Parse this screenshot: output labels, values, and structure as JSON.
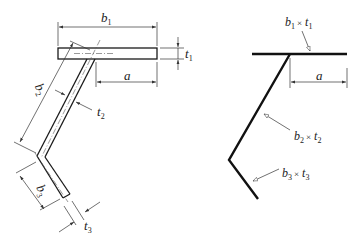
{
  "diagram": {
    "colors": {
      "stroke": "#1a1a1a",
      "dim": "#333333",
      "text": "#222222",
      "background": "#ffffff"
    },
    "left_figure": {
      "description": "Z-shaped section with flange, web and lip, dimensioned",
      "labels": {
        "b1": {
          "base": "b",
          "sub": "1"
        },
        "t1": {
          "base": "t",
          "sub": "1"
        },
        "a": {
          "base": "a"
        },
        "b2": {
          "base": "b",
          "sub": "2"
        },
        "t2": {
          "base": "t",
          "sub": "2"
        },
        "b3": {
          "base": "b",
          "sub": "3"
        },
        "t3": {
          "base": "t",
          "sub": "3"
        }
      }
    },
    "right_figure": {
      "description": "Centerline model of the same section",
      "labels": {
        "b1t1": {
          "b": "b",
          "b_sub": "1",
          "x": "×",
          "t": "t",
          "t_sub": "1"
        },
        "a": {
          "base": "a"
        },
        "b2t2": {
          "b": "b",
          "b_sub": "2",
          "x": "×",
          "t": "t",
          "t_sub": "2"
        },
        "b3t3": {
          "b": "b",
          "b_sub": "3",
          "x": "×",
          "t": "t",
          "t_sub": "3"
        }
      }
    }
  }
}
